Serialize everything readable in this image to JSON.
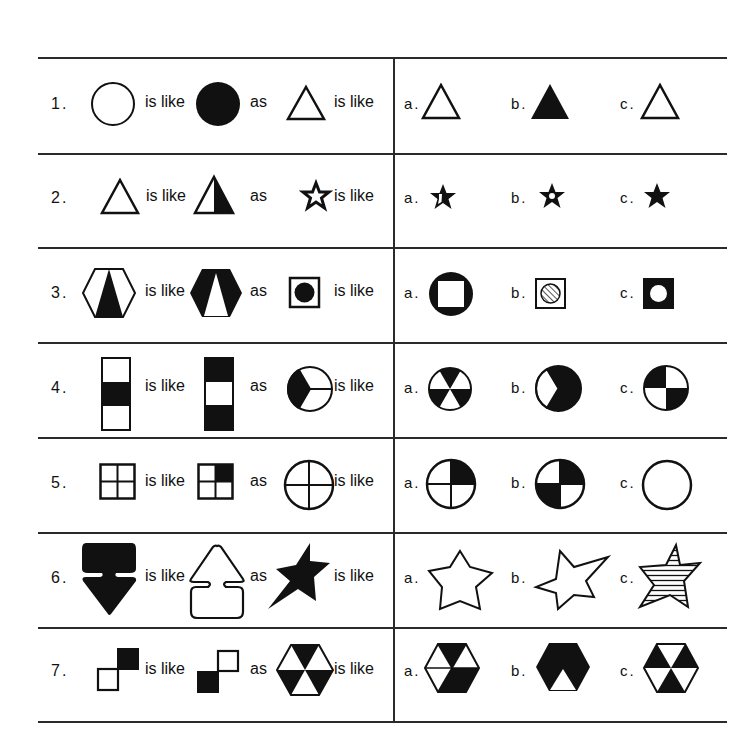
{
  "worksheet": {
    "connector_is_like": "is like",
    "connector_as": "as",
    "questions": [
      {
        "number": "1.",
        "A": "empty circle",
        "B": "filled black circle",
        "C": "empty triangle",
        "options": [
          {
            "label": "a.",
            "shape": "empty triangle"
          },
          {
            "label": "b.",
            "shape": "filled black triangle"
          },
          {
            "label": "c.",
            "shape": "empty triangle"
          }
        ]
      },
      {
        "number": "2.",
        "A": "empty triangle",
        "B": "triangle with right half black",
        "C": "outlined star",
        "options": [
          {
            "label": "a.",
            "shape": "star with right half filled"
          },
          {
            "label": "b.",
            "shape": "black star with white dot"
          },
          {
            "label": "c.",
            "shape": "filled black star"
          }
        ]
      },
      {
        "number": "3.",
        "A": "white hexagon with black inner triangle",
        "B": "black hexagon with white inner triangle",
        "C": "white square with black circle",
        "options": [
          {
            "label": "a.",
            "shape": "black circle with white square"
          },
          {
            "label": "b.",
            "shape": "white square with hatched circle"
          },
          {
            "label": "c.",
            "shape": "black square with white circle"
          }
        ]
      },
      {
        "number": "4.",
        "A": "bar white-black-white",
        "B": "bar black-white-black",
        "C": "circle thirds with one black third",
        "options": [
          {
            "label": "a.",
            "shape": "circle sixths alternating black"
          },
          {
            "label": "b.",
            "shape": "black circle with white wedge"
          },
          {
            "label": "c.",
            "shape": "circle quarters checkered"
          }
        ]
      },
      {
        "number": "5.",
        "A": "empty square quartered",
        "B": "square quartered top-right black",
        "C": "empty circle quartered",
        "options": [
          {
            "label": "a.",
            "shape": "circle quartered top-right black"
          },
          {
            "label": "b.",
            "shape": "circle quartered top-right and bottom-left black"
          },
          {
            "label": "c.",
            "shape": "empty circle"
          }
        ]
      },
      {
        "number": "6.",
        "A": "black down arrow",
        "B": "outlined up arrow",
        "C": "black star tilted",
        "options": [
          {
            "label": "a.",
            "shape": "outlined star"
          },
          {
            "label": "b.",
            "shape": "outlined tilted star"
          },
          {
            "label": "c.",
            "shape": "horizontally striped star"
          }
        ]
      },
      {
        "number": "7.",
        "A": "two squares diagonal top-right black",
        "B": "two squares diagonal bottom-left black",
        "C": "hexagon with alternating black triangles",
        "options": [
          {
            "label": "a.",
            "shape": "hexagon with mixed black triangles"
          },
          {
            "label": "b.",
            "shape": "black hexagon with white bottom triangle"
          },
          {
            "label": "c.",
            "shape": "hexagon alternating triangles inverted"
          }
        ]
      }
    ]
  }
}
